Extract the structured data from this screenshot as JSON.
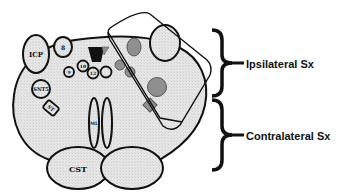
{
  "diagram": {
    "structures": {
      "icp": "ICP",
      "n8": "8",
      "n9": "9",
      "n10": "10",
      "n12": "12",
      "snt5": "SNT5",
      "st": "ST",
      "ml": "ML",
      "cst": "CST"
    },
    "braces": [
      {
        "label": "Ipsilateral Sx"
      },
      {
        "label": "Contralateral Sx"
      }
    ],
    "colors": {
      "fill_light": "#e4e4e4",
      "fill_shaded": "#8f8f8f",
      "fill_black": "#111111",
      "stroke": "#111111"
    }
  }
}
